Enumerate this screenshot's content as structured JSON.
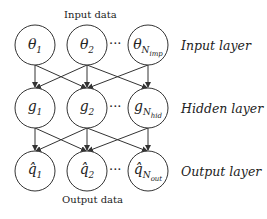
{
  "captions": {
    "top": "Input data",
    "bottom": "Output data"
  },
  "layers": [
    {
      "label": "Input layer",
      "nodes": [
        {
          "base": "θ",
          "sub": "1"
        },
        {
          "base": "θ",
          "sub": "2"
        },
        {
          "base": "θ",
          "sub": "N_imp"
        }
      ]
    },
    {
      "label": "Hidden layer",
      "nodes": [
        {
          "base": "g",
          "sub": "1"
        },
        {
          "base": "g",
          "sub": "2"
        },
        {
          "base": "g",
          "sub": "N_hid"
        }
      ]
    },
    {
      "label": "Output layer",
      "nodes": [
        {
          "base": "q̂",
          "sub": "1"
        },
        {
          "base": "q̂",
          "sub": "2"
        },
        {
          "base": "q̂",
          "sub": "N_out"
        }
      ]
    }
  ],
  "ellipsis": "···",
  "display": {
    "l0": {
      "n0b": "θ",
      "n0s": "1",
      "n1b": "θ",
      "n1s": "2",
      "n2b": "θ",
      "n2s": "N",
      "n2ss": "imp"
    },
    "l1": {
      "n0b": "g",
      "n0s": "1",
      "n1b": "g",
      "n1s": "2",
      "n2b": "g",
      "n2s": "N",
      "n2ss": "hid"
    },
    "l2": {
      "n0b": "q̂",
      "n0s": "1",
      "n1b": "q̂",
      "n1s": "2",
      "n2b": "q̂",
      "n2s": "N",
      "n2ss": "out"
    }
  }
}
